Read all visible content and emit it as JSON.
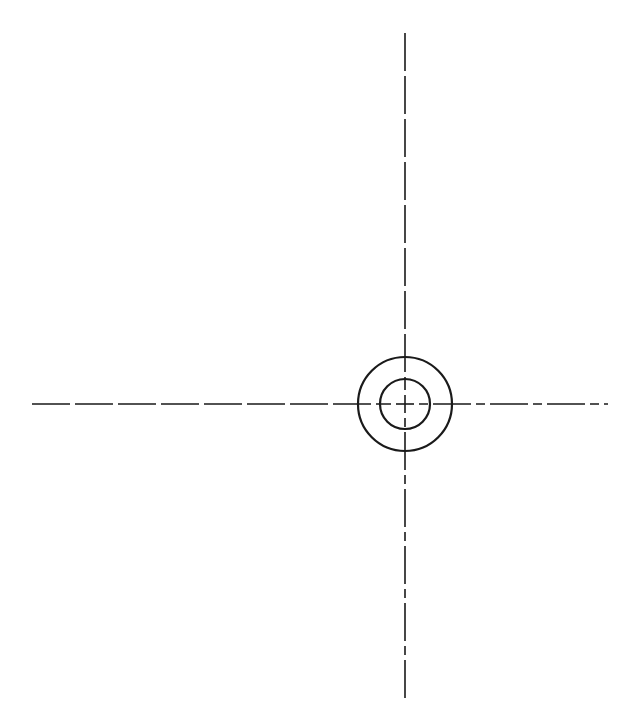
{
  "canvas": {
    "width": 642,
    "height": 704,
    "background_color": "#ffffff",
    "title": "Concentric Circles with Center Lines"
  },
  "style": {
    "object_line_color": "#1a1a1a",
    "object_line_width": 2.2,
    "center_line_color": "#1a1a1a",
    "center_line_width": 1.6,
    "center_line_dasharray": "38 5",
    "center_line_dasharray_short": "9 5"
  },
  "geometry": {
    "center": {
      "x": 405,
      "y": 404
    },
    "circles": [
      {
        "name": "outer-circle",
        "cx": 405,
        "cy": 404,
        "r": 47,
        "stroke": "#1a1a1a",
        "stroke_width": 2.2,
        "fill": "none"
      },
      {
        "name": "inner-circle",
        "cx": 405,
        "cy": 404,
        "r": 25,
        "stroke": "#1a1a1a",
        "stroke_width": 2.2,
        "fill": "none"
      }
    ],
    "center_lines": [
      {
        "name": "horizontal-center-line",
        "orientation": "horizontal",
        "x1": 32,
        "y1": 404,
        "x2": 608,
        "y2": 404,
        "length": 576,
        "stroke": "#1a1a1a",
        "stroke_width": 1.6,
        "dasharray": "38 5"
      },
      {
        "name": "vertical-center-line",
        "orientation": "vertical",
        "x1": 405,
        "y1": 33,
        "x2": 405,
        "y2": 702,
        "length": 669,
        "stroke": "#1a1a1a",
        "stroke_width": 1.6,
        "dasharray": "38 5"
      }
    ],
    "center_mark": {
      "name": "center-cross-mark",
      "arm_length": 9,
      "gap": 4,
      "stroke": "#1a1a1a",
      "stroke_width": 1.6
    }
  },
  "chart_data": {
    "type": "scatter",
    "xlabel": "",
    "ylabel": "",
    "xlim": [
      0,
      642
    ],
    "ylim": [
      0,
      704
    ],
    "grid": false,
    "legend": "none",
    "annotations": [],
    "series": [
      {
        "name": "outer-circle",
        "shape": "circle",
        "center": [
          405,
          404
        ],
        "radius": 47,
        "values": [
          47
        ]
      },
      {
        "name": "inner-circle",
        "shape": "circle",
        "center": [
          405,
          404
        ],
        "radius": 25,
        "values": [
          25
        ]
      },
      {
        "name": "horizontal-center-line",
        "shape": "line",
        "x": [
          32,
          608
        ],
        "values": [
          404,
          404
        ]
      },
      {
        "name": "vertical-center-line",
        "shape": "line",
        "x": [
          405,
          405
        ],
        "values": [
          33,
          702
        ]
      }
    ]
  }
}
